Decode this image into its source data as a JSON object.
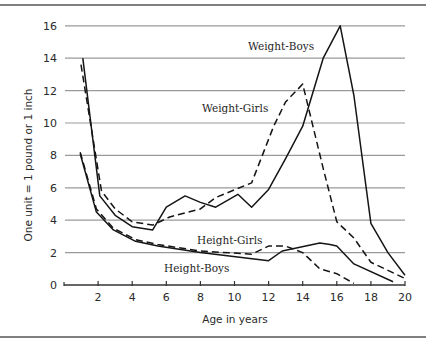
{
  "chart_data": {
    "type": "line",
    "title": "",
    "xlabel": "Age in years",
    "ylabel": "One unit = 1 pound or 1 inch",
    "xlim": [
      0,
      20
    ],
    "ylim": [
      0,
      16
    ],
    "x_ticks": [
      2,
      4,
      6,
      8,
      10,
      12,
      14,
      16,
      18,
      20
    ],
    "x_tick_labels": [
      "2",
      "4",
      "6",
      "8",
      "10",
      "12",
      "14",
      "16",
      "18",
      "20"
    ],
    "y_ticks": [
      0,
      2,
      4,
      6,
      8,
      10,
      12,
      14,
      16
    ],
    "y_tick_labels": [
      "0",
      "2",
      "4",
      "6",
      "8",
      "10",
      "12",
      "14",
      "16"
    ],
    "grid": "horizontal",
    "legend": "inline labels",
    "series": [
      {
        "name": "Weight-Boys",
        "style": "solid",
        "x": [
          1.1,
          2.1,
          3,
          4,
          5.2,
          6,
          7.1,
          8,
          8.9,
          10.2,
          11,
          12,
          13,
          14,
          15.2,
          16.2,
          17,
          18,
          19,
          20
        ],
        "y": [
          14.0,
          5.5,
          4.3,
          3.6,
          3.4,
          4.8,
          5.5,
          5.1,
          4.8,
          5.6,
          4.8,
          5.9,
          7.8,
          9.8,
          14.0,
          16.0,
          11.7,
          3.8,
          2.0,
          0.6
        ]
      },
      {
        "name": "Weight-Girls",
        "style": "dashed",
        "x": [
          1.0,
          2.2,
          3,
          4,
          5.2,
          6.2,
          8,
          8.9,
          11,
          12.3,
          13,
          14,
          15.2,
          16,
          17,
          18,
          20
        ],
        "y": [
          13.6,
          5.8,
          4.7,
          3.9,
          3.7,
          4.2,
          4.7,
          5.4,
          6.3,
          9.8,
          11.3,
          12.4,
          7.2,
          3.9,
          2.9,
          1.4,
          0.4
        ]
      },
      {
        "name": "Height-Girls",
        "style": "dashed",
        "x": [
          0.95,
          1.9,
          2.9,
          4.2,
          5.5,
          8,
          11,
          12,
          13,
          14,
          15,
          16,
          17
        ],
        "y": [
          8.2,
          4.7,
          3.5,
          2.8,
          2.5,
          2.1,
          1.9,
          2.4,
          2.4,
          2.0,
          1.0,
          0.7,
          0.1
        ]
      },
      {
        "name": "Height-Boys",
        "style": "solid",
        "x": [
          0.95,
          1.9,
          2.9,
          4.2,
          5.5,
          8,
          12,
          12.8,
          15,
          15.6,
          16,
          17,
          19.3
        ],
        "y": [
          8.1,
          4.5,
          3.4,
          2.7,
          2.4,
          2.0,
          1.5,
          2.1,
          2.6,
          2.5,
          2.4,
          1.3,
          0.2
        ]
      }
    ],
    "annotations": [
      {
        "text": "Weight-Boys",
        "x": 12.9,
        "y": 14.9
      },
      {
        "text": "Weight-Girls",
        "x": 8.1,
        "y": 10.7
      },
      {
        "text": "Height-Girls",
        "x": 7.8,
        "y": 2.6
      },
      {
        "text": "Height-Boys",
        "x": 5.9,
        "y": 0.9
      }
    ]
  },
  "labels": {
    "ylabel": "One unit = 1 pound or 1 inch",
    "xlabel": "Age in years",
    "series": {
      "weight_boys": "Weight-Boys",
      "weight_girls": "Weight-Girls",
      "height_girls": "Height-Girls",
      "height_boys": "Height-Boys"
    },
    "x_ticks": [
      "2",
      "4",
      "6",
      "8",
      "10",
      "12",
      "14",
      "16",
      "18",
      "20"
    ],
    "y_ticks": [
      "0",
      "2",
      "4",
      "6",
      "8",
      "10",
      "12",
      "14",
      "16"
    ]
  }
}
